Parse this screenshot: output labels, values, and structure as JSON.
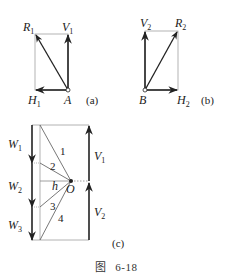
{
  "figure": {
    "caption_prefix": "图",
    "caption_number": "6-18"
  },
  "panel_a": {
    "tag": "(a)",
    "point": "A",
    "vectors": {
      "R": {
        "base": "R",
        "sub": "1"
      },
      "V": {
        "base": "V",
        "sub": "1"
      },
      "H": {
        "base": "H",
        "sub": "1"
      }
    }
  },
  "panel_b": {
    "tag": "(b)",
    "point": "B",
    "vectors": {
      "V": {
        "base": "V",
        "sub": "2"
      },
      "R": {
        "base": "R",
        "sub": "2"
      },
      "H": {
        "base": "H",
        "sub": "2"
      }
    }
  },
  "panel_c": {
    "tag": "(c)",
    "pole": "O",
    "pole_distance": "h",
    "loads": [
      {
        "base": "W",
        "sub": "1"
      },
      {
        "base": "W",
        "sub": "2"
      },
      {
        "base": "W",
        "sub": "3"
      }
    ],
    "reactions": [
      {
        "base": "V",
        "sub": "1"
      },
      {
        "base": "V",
        "sub": "2"
      }
    ],
    "rays": [
      "1",
      "2",
      "3",
      "4"
    ]
  },
  "colors": {
    "line": "#222222",
    "thin_line": "#9a9a9a"
  }
}
